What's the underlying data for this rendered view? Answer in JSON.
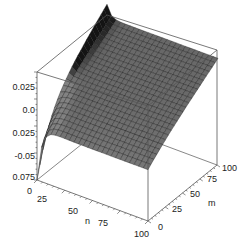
{
  "chart_data": {
    "type": "surface3d",
    "title": "",
    "xlabel": "n",
    "ylabel": "m",
    "zlabel": "",
    "x_ticks": [
      "25",
      "50",
      "75",
      "100"
    ],
    "y_ticks": [
      "0",
      "25",
      "50",
      "75",
      "100"
    ],
    "z_ticks": [
      "0.025",
      "0.0",
      "-0.025",
      "-0.05",
      "-0.075"
    ],
    "z_ticks_as_rendered": [
      "0.025",
      "0.0",
      "0.025",
      "-0.05",
      "0.075"
    ],
    "origin_label": "0",
    "xlim": [
      0,
      100
    ],
    "ylim": [
      0,
      100
    ],
    "zlim": [
      -0.075,
      0.035
    ],
    "grid": false,
    "boxed": true,
    "surface_color": "#2a2a2a",
    "sample_points": [
      {
        "n": 0,
        "m": 0,
        "z": -0.075
      },
      {
        "n": 0,
        "m": 25,
        "z": -0.02
      },
      {
        "n": 0,
        "m": 100,
        "z": 0.03
      },
      {
        "n": 25,
        "m": 0,
        "z": -0.03
      },
      {
        "n": 50,
        "m": 0,
        "z": -0.022
      },
      {
        "n": 100,
        "m": 0,
        "z": -0.02
      },
      {
        "n": 50,
        "m": 50,
        "z": 0.005
      },
      {
        "n": 100,
        "m": 100,
        "z": 0.02
      }
    ]
  },
  "axes": {
    "n_label": "n",
    "m_label": "m",
    "n_ticks": [
      {
        "label": "25",
        "x": 37,
        "y": 202
      },
      {
        "label": "50",
        "x": 68,
        "y": 214
      },
      {
        "label": "75",
        "x": 98,
        "y": 226
      },
      {
        "label": "100",
        "x": 134,
        "y": 237
      }
    ],
    "m_ticks": [
      {
        "label": "0",
        "x": 158,
        "y": 230
      },
      {
        "label": "25",
        "x": 172,
        "y": 212
      },
      {
        "label": "50",
        "x": 190,
        "y": 197
      },
      {
        "label": "75",
        "x": 207,
        "y": 182
      },
      {
        "label": "100",
        "x": 228,
        "y": 171
      }
    ],
    "z_ticks": [
      {
        "label": "0.025",
        "x": 35,
        "y": 90
      },
      {
        "label": "0.0",
        "x": 35,
        "y": 113
      },
      {
        "label": "0.025",
        "x": 35,
        "y": 136
      },
      {
        "label": "-0.05",
        "x": 35,
        "y": 159
      },
      {
        "label": "0.075",
        "x": 35,
        "y": 180
      }
    ],
    "origin": {
      "label": "0",
      "x": 27,
      "y": 194
    }
  }
}
